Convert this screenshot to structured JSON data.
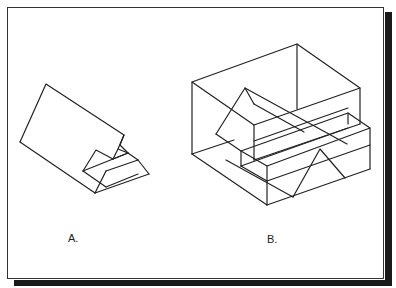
{
  "figure": {
    "frame": {
      "border_color": "#333333",
      "shadow_color": "#1a1a1a",
      "background": "#ffffff"
    },
    "panels": [
      {
        "id": "A",
        "label": "A.",
        "description": "Isometric view of a wedge-shaped block with a notch cut and a trapezoidal prism base"
      },
      {
        "id": "B",
        "label": "B.",
        "description": "Transparent bounding box showing the same object inside its enclosing rectangular volume"
      }
    ]
  }
}
